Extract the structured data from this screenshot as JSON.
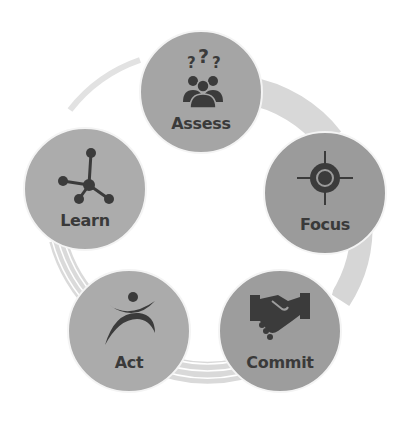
{
  "diagram": {
    "type": "cycle",
    "ring_color": "#d4d4d4",
    "ring_line_color": "#ffffff",
    "icon_color": "#3b3b3b",
    "nodes": [
      {
        "id": "assess",
        "label": "Assess",
        "icon": "people-question-icon",
        "color": "#a5a5a5",
        "cx": 201,
        "cy": 92
      },
      {
        "id": "focus",
        "label": "Focus",
        "icon": "target-icon",
        "color": "#9b9b9b",
        "cx": 325,
        "cy": 193
      },
      {
        "id": "commit",
        "label": "Commit",
        "icon": "handshake-icon",
        "color": "#9d9d9d",
        "cx": 280,
        "cy": 331
      },
      {
        "id": "act",
        "label": "Act",
        "icon": "person-act-icon",
        "color": "#ababab",
        "cx": 129,
        "cy": 331
      },
      {
        "id": "learn",
        "label": "Learn",
        "icon": "network-icon",
        "color": "#acacac",
        "cx": 85,
        "cy": 189
      }
    ]
  }
}
